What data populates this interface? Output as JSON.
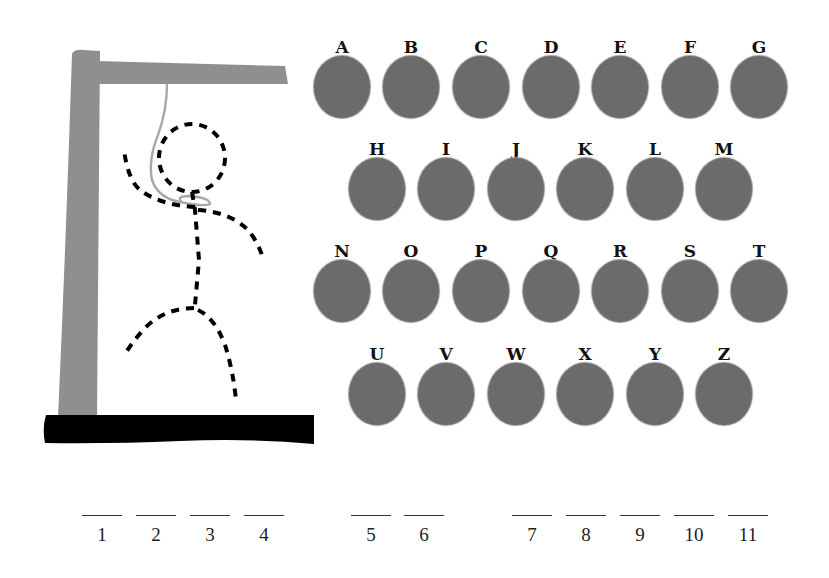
{
  "game": {
    "name": "Hangman",
    "colors": {
      "gallows": "#8f8f8f",
      "base": "#000000",
      "rope": "#a8a8a8",
      "figure_dashes": "#000000",
      "letter_disc": "#6b6b6b",
      "letter_label": "#111111"
    },
    "hangman_parts_drawn": [
      "head",
      "body",
      "left-arm",
      "right-arm",
      "left-leg",
      "right-leg"
    ]
  },
  "letters": {
    "rows": [
      [
        "A",
        "B",
        "C",
        "D",
        "E",
        "F",
        "G"
      ],
      [
        "H",
        "I",
        "J",
        "K",
        "L",
        "M"
      ],
      [
        "N",
        "O",
        "P",
        "Q",
        "R",
        "S",
        "T"
      ],
      [
        "U",
        "V",
        "W",
        "X",
        "Y",
        "Z"
      ]
    ],
    "items": [
      {
        "label": "A",
        "x": 312,
        "y": 36
      },
      {
        "label": "B",
        "x": 381,
        "y": 36
      },
      {
        "label": "C",
        "x": 451,
        "y": 36
      },
      {
        "label": "D",
        "x": 521,
        "y": 36
      },
      {
        "label": "E",
        "x": 590,
        "y": 36
      },
      {
        "label": "F",
        "x": 660,
        "y": 36
      },
      {
        "label": "G",
        "x": 729,
        "y": 36
      },
      {
        "label": "H",
        "x": 347,
        "y": 138
      },
      {
        "label": "I",
        "x": 416,
        "y": 138
      },
      {
        "label": "J",
        "x": 486,
        "y": 138
      },
      {
        "label": "K",
        "x": 555,
        "y": 138
      },
      {
        "label": "L",
        "x": 625,
        "y": 138
      },
      {
        "label": "M",
        "x": 694,
        "y": 138
      },
      {
        "label": "N",
        "x": 312,
        "y": 240
      },
      {
        "label": "O",
        "x": 381,
        "y": 240
      },
      {
        "label": "P",
        "x": 451,
        "y": 240
      },
      {
        "label": "Q",
        "x": 521,
        "y": 240
      },
      {
        "label": "R",
        "x": 590,
        "y": 240
      },
      {
        "label": "S",
        "x": 660,
        "y": 240
      },
      {
        "label": "T",
        "x": 729,
        "y": 240
      },
      {
        "label": "U",
        "x": 347,
        "y": 343
      },
      {
        "label": "V",
        "x": 416,
        "y": 343
      },
      {
        "label": "W",
        "x": 486,
        "y": 343
      },
      {
        "label": "X",
        "x": 555,
        "y": 343
      },
      {
        "label": "Y",
        "x": 625,
        "y": 343
      },
      {
        "label": "Z",
        "x": 694,
        "y": 343
      }
    ]
  },
  "word": {
    "length": 11,
    "blanks": [
      {
        "num": "1",
        "x": 82,
        "value": ""
      },
      {
        "num": "2",
        "x": 136,
        "value": ""
      },
      {
        "num": "3",
        "x": 190,
        "value": ""
      },
      {
        "num": "4",
        "x": 244,
        "value": ""
      },
      {
        "num": "5",
        "x": 351,
        "value": ""
      },
      {
        "num": "6",
        "x": 404,
        "value": ""
      },
      {
        "num": "7",
        "x": 512,
        "value": ""
      },
      {
        "num": "8",
        "x": 566,
        "value": ""
      },
      {
        "num": "9",
        "x": 620,
        "value": ""
      },
      {
        "num": "10",
        "x": 674,
        "value": ""
      },
      {
        "num": "11",
        "x": 728,
        "value": ""
      }
    ],
    "blank_y": 515
  }
}
